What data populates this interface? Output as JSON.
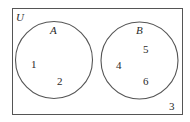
{
  "diagram": {
    "type": "venn",
    "universe": {
      "label": "U",
      "elements_outside_sets": [
        "3"
      ]
    },
    "sets": [
      {
        "label": "A",
        "elements": [
          "1",
          "2"
        ]
      },
      {
        "label": "B",
        "elements": [
          "4",
          "5",
          "6"
        ]
      }
    ],
    "intersection": [],
    "colors": {
      "stroke": "#555555",
      "text": "#2a2a2a",
      "background": "#ffffff"
    }
  }
}
